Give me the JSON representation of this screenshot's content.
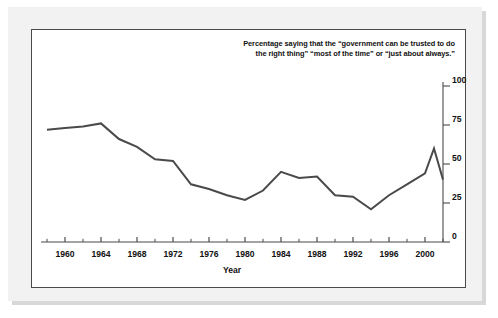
{
  "caption": {
    "line1": "Percentage saying that the “government can be trusted to do",
    "line2": "the right thing” “most of the time” or “just about always.”"
  },
  "axis_title_x": "Year",
  "colors": {
    "line": "#4a4a4a",
    "frame": "#4a4a4a",
    "mat": "#f2f2f2",
    "shadow": "#d8d8d8",
    "text": "#111111"
  },
  "chart_data": {
    "type": "line",
    "title": "",
    "subtitle": "",
    "xlabel": "Year",
    "ylabel": "",
    "xlim": [
      1958,
      2002
    ],
    "ylim": [
      0,
      100
    ],
    "grid": false,
    "legend": false,
    "legend_position": "none",
    "y_ticks": [
      0,
      25,
      50,
      75,
      100
    ],
    "y_tick_labels": [
      "0",
      "25",
      "50",
      "75",
      "100"
    ],
    "y_axis_side": "right",
    "x_ticks": [
      1960,
      1964,
      1968,
      1972,
      1976,
      1980,
      1984,
      1988,
      1992,
      1996,
      2000
    ],
    "x_tick_labels": [
      "1960",
      "1964",
      "1968",
      "1972",
      "1976",
      "1980",
      "1984",
      "1988",
      "1992",
      "1996",
      "2000"
    ],
    "x_minor_tick_interval": 2,
    "annotations": [
      "Percentage saying that the “government can be trusted to do the right thing” “most of the time” or “just about always.”"
    ],
    "series": [
      {
        "name": "Trust in government",
        "color": "#4a4a4a",
        "x": [
          1958,
          1960,
          1962,
          1964,
          1966,
          1968,
          1970,
          1972,
          1974,
          1976,
          1978,
          1980,
          1982,
          1984,
          1986,
          1988,
          1990,
          1992,
          1994,
          1996,
          1998,
          2000,
          2001,
          2002
        ],
        "values": [
          72,
          73,
          74,
          76,
          66,
          61,
          53,
          52,
          37,
          34,
          30,
          27,
          33,
          45,
          41,
          42,
          30,
          29,
          21,
          30,
          37,
          44,
          60,
          40
        ]
      }
    ]
  }
}
